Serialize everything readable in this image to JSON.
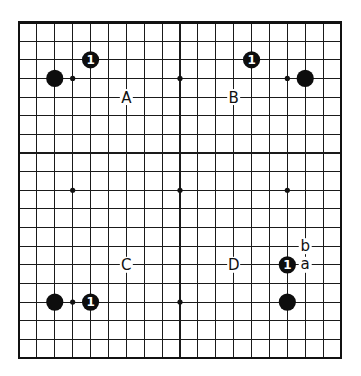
{
  "diagram": {
    "type": "go-board",
    "size": 19,
    "colors": {
      "background": "#ffffff",
      "lines": "#1a1a1a",
      "black_stone": "#0d0d0d",
      "stone_label": "#ffffff"
    },
    "star_points": [
      {
        "col": 3,
        "row": 3
      },
      {
        "col": 9,
        "row": 3
      },
      {
        "col": 15,
        "row": 3
      },
      {
        "col": 3,
        "row": 9
      },
      {
        "col": 9,
        "row": 9
      },
      {
        "col": 15,
        "row": 9
      },
      {
        "col": 3,
        "row": 15
      },
      {
        "col": 9,
        "row": 15
      },
      {
        "col": 15,
        "row": 15
      }
    ],
    "black_stones": [
      {
        "col": 2,
        "row": 3
      },
      {
        "col": 16,
        "row": 3
      },
      {
        "col": 2,
        "row": 15
      },
      {
        "col": 15,
        "row": 15
      }
    ],
    "numbered_stones": [
      {
        "col": 4,
        "row": 2,
        "label": "1",
        "color": "black"
      },
      {
        "col": 13,
        "row": 2,
        "label": "1",
        "color": "black"
      },
      {
        "col": 4,
        "row": 15,
        "label": "1",
        "color": "black"
      },
      {
        "col": 15,
        "row": 13,
        "label": "1",
        "color": "black"
      }
    ],
    "point_labels": [
      {
        "col": 6,
        "row": 4,
        "label": "A"
      },
      {
        "col": 12,
        "row": 4,
        "label": "B"
      },
      {
        "col": 6,
        "row": 13,
        "label": "C"
      },
      {
        "col": 12,
        "row": 13,
        "label": "D"
      },
      {
        "col": 16,
        "row": 12,
        "label": "b"
      },
      {
        "col": 16,
        "row": 13,
        "label": "a"
      }
    ]
  }
}
